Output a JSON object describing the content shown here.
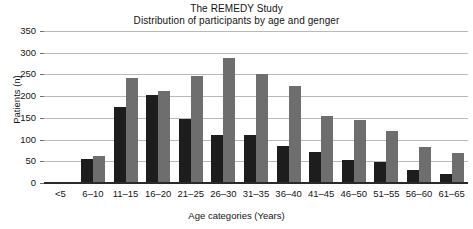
{
  "chart_data": {
    "type": "bar",
    "title": "The REMEDY Study",
    "subtitle": "Distribution of participants by age and genger",
    "xlabel": "Age categories (Years)",
    "ylabel": "Patients (n)",
    "categories": [
      "<5",
      "6–10",
      "11–15",
      "16–20",
      "21–25",
      "26–30",
      "31–35",
      "36–40",
      "41–45",
      "46–50",
      "51–55",
      "56–60",
      "61–65"
    ],
    "series": [
      {
        "name": "male",
        "color": "#1d1d1d",
        "values": [
          3,
          58,
          178,
          205,
          150,
          112,
          113,
          88,
          73,
          55,
          50,
          32,
          23
        ]
      },
      {
        "name": "female",
        "color": "#6e6e6e",
        "values": [
          5,
          65,
          245,
          215,
          248,
          290,
          253,
          225,
          157,
          148,
          123,
          85,
          72
        ]
      }
    ],
    "ylim": [
      0,
      350
    ],
    "yticks": [
      0,
      50,
      100,
      150,
      200,
      250,
      300,
      350
    ],
    "ytick_labels": [
      "0",
      "50",
      "100",
      "150",
      "200",
      "250",
      "300",
      "350"
    ],
    "grid": true,
    "legend": "none"
  }
}
